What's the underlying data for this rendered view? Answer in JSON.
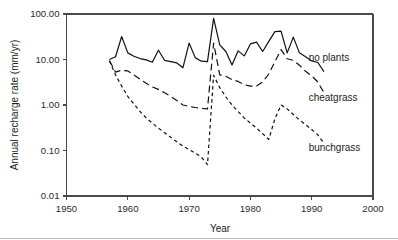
{
  "figure": {
    "background_color": "#ffffff",
    "axis_color": "#4a4a4a",
    "line_color": "#111111",
    "text_color": "#1d1d1d"
  },
  "chart_data": {
    "type": "line",
    "title": "",
    "xlabel": "Year",
    "ylabel": "Annual recharge rate (mm/yr)",
    "xlim": [
      1950,
      2000
    ],
    "ylim": [
      0.01,
      100.0
    ],
    "yscale": "log",
    "xscale": "linear",
    "grid": false,
    "legend_position": "inline-right",
    "xticks": [
      1950,
      1960,
      1970,
      1980,
      1990,
      2000
    ],
    "xtick_labels": [
      "1950",
      "1960",
      "1970",
      "1980",
      "1990",
      "2000"
    ],
    "yticks": [
      0.01,
      0.1,
      1.0,
      10.0,
      100.0
    ],
    "ytick_labels": [
      "0.01",
      "0.10",
      "1.00",
      "10.00",
      "100.00"
    ],
    "series": [
      {
        "name": "no plants",
        "label": "no plants",
        "linestyle": "solid",
        "dash_pattern": "none",
        "stroke_width": 1.2,
        "label_x": 1989.5,
        "label_y": 11.0,
        "x": [
          1957,
          1958,
          1959,
          1960,
          1961,
          1962,
          1963,
          1964,
          1965,
          1966,
          1967,
          1968,
          1969,
          1970,
          1971,
          1972,
          1973,
          1974,
          1975,
          1976,
          1977,
          1978,
          1979,
          1980,
          1981,
          1982,
          1983,
          1984,
          1985,
          1986,
          1987,
          1988,
          1989,
          1990,
          1991,
          1992
        ],
        "y": [
          10.0,
          11.5,
          32.0,
          14.0,
          11.8,
          10.5,
          9.8,
          8.7,
          16.0,
          9.6,
          9.0,
          8.4,
          6.6,
          23.0,
          11.0,
          9.2,
          9.0,
          80.0,
          21.0,
          15.0,
          7.6,
          15.5,
          12.0,
          22.0,
          24.0,
          15.0,
          25.0,
          41.0,
          42.0,
          14.0,
          31.0,
          14.0,
          11.5,
          9.3,
          8.6,
          5.4
        ]
      },
      {
        "name": "cheatgrass",
        "label": "cheatgrass",
        "linestyle": "dashed",
        "dash_pattern": "7,4",
        "stroke_width": 1.2,
        "label_x": 1989.5,
        "label_y": 1.45,
        "x": [
          1957,
          1958,
          1959,
          1960,
          1961,
          1962,
          1963,
          1964,
          1965,
          1966,
          1967,
          1968,
          1969,
          1970,
          1971,
          1972,
          1973,
          1974,
          1975,
          1976,
          1977,
          1978,
          1979,
          1980,
          1981,
          1982,
          1983,
          1984,
          1985,
          1986,
          1987,
          1988,
          1989,
          1990,
          1991,
          1992
        ],
        "y": [
          9.5,
          5.3,
          5.8,
          5.6,
          4.6,
          3.7,
          3.0,
          2.5,
          2.2,
          1.85,
          1.55,
          1.25,
          1.0,
          0.93,
          0.88,
          0.84,
          0.82,
          23.0,
          4.6,
          4.3,
          3.6,
          3.3,
          2.8,
          2.6,
          2.6,
          3.2,
          4.8,
          9.0,
          16.5,
          10.4,
          9.6,
          7.5,
          5.5,
          4.4,
          3.2,
          1.85
        ]
      },
      {
        "name": "bunchgrass",
        "label": "bunchgrass",
        "linestyle": "dotted-dashed",
        "dash_pattern": "3.5,3",
        "stroke_width": 1.2,
        "label_x": 1989.5,
        "label_y": 0.115,
        "x": [
          1957,
          1958,
          1959,
          1960,
          1961,
          1962,
          1963,
          1964,
          1965,
          1966,
          1967,
          1968,
          1969,
          1970,
          1971,
          1972,
          1973,
          1974,
          1975,
          1976,
          1977,
          1978,
          1979,
          1980,
          1981,
          1982,
          1983,
          1984,
          1985,
          1986,
          1987,
          1988,
          1989,
          1990,
          1991,
          1992
        ],
        "y": [
          9.3,
          4.6,
          2.6,
          1.55,
          1.05,
          0.72,
          0.52,
          0.4,
          0.31,
          0.245,
          0.195,
          0.155,
          0.125,
          0.105,
          0.088,
          0.072,
          0.049,
          4.5,
          2.4,
          1.5,
          1.0,
          0.72,
          0.52,
          0.4,
          0.31,
          0.235,
          0.175,
          0.5,
          1.0,
          0.82,
          0.62,
          0.47,
          0.37,
          0.29,
          0.22,
          0.145
        ]
      }
    ]
  }
}
